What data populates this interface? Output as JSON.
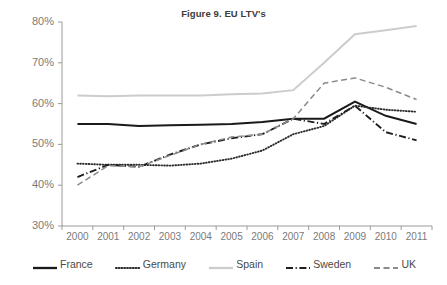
{
  "chart": {
    "title": "Figure 9. EU LTV's",
    "legend_position": "bottom"
  },
  "chart_data": {
    "type": "line",
    "title": "Figure 9. EU LTV's",
    "xlabel": "",
    "ylabel": "",
    "categories": [
      "2000",
      "2001",
      "2002",
      "2003",
      "2004",
      "2005",
      "2006",
      "2007",
      "2008",
      "2009",
      "2010",
      "2011"
    ],
    "ylim": [
      30,
      80
    ],
    "yticks": [
      30,
      40,
      50,
      60,
      70,
      80
    ],
    "ytick_labels": [
      "30%",
      "40%",
      "50%",
      "60%",
      "70%",
      "80%"
    ],
    "y_unit": "%",
    "grid": false,
    "series": [
      {
        "name": "France",
        "style": "solid",
        "color": "#1a1a1a",
        "values": [
          55.0,
          55.0,
          54.5,
          54.7,
          54.8,
          55.0,
          55.5,
          56.3,
          56.3,
          60.5,
          57.0,
          55.0
        ]
      },
      {
        "name": "Germany",
        "style": "dotted",
        "color": "#2b2b2b",
        "values": [
          45.3,
          45.0,
          45.0,
          44.8,
          45.3,
          46.5,
          48.5,
          52.5,
          54.5,
          59.5,
          58.5,
          58.0
        ]
      },
      {
        "name": "Spain",
        "style": "solid",
        "color": "#cccccc",
        "values": [
          62.0,
          61.8,
          62.0,
          62.0,
          62.0,
          62.3,
          62.5,
          63.3,
          70.0,
          77.0,
          78.0,
          79.0
        ]
      },
      {
        "name": "Sweden",
        "style": "dash-dot",
        "color": "#1f1f1f",
        "values": [
          42.0,
          45.0,
          44.5,
          47.5,
          50.0,
          51.5,
          52.5,
          56.3,
          55.0,
          59.5,
          53.0,
          51.0
        ]
      },
      {
        "name": "UK",
        "style": "dashed",
        "color": "#8a8a8a",
        "values": [
          40.0,
          44.8,
          44.5,
          47.3,
          50.0,
          51.8,
          52.5,
          56.3,
          65.0,
          66.3,
          64.0,
          61.0
        ]
      }
    ]
  }
}
